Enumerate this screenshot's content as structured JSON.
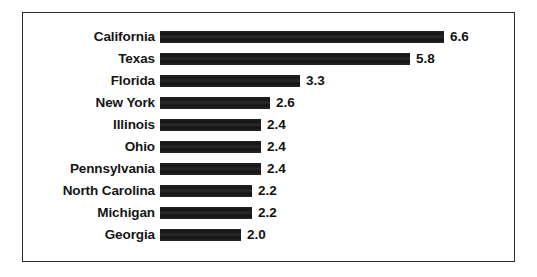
{
  "figure": {
    "frame_color": "#2b2b2b",
    "background_color": "#ffffff",
    "bar_color": "#1c1c1c",
    "text_color": "#151515"
  },
  "chart_data": {
    "type": "bar",
    "orientation": "horizontal",
    "title": "",
    "subtitle": "",
    "xlabel": "",
    "ylabel": "",
    "legend": [],
    "grid": false,
    "value_labels_shown": true,
    "xlim": [
      0,
      6.6
    ],
    "categories": [
      "California",
      "Texas",
      "Florida",
      "New York",
      "Illinois",
      "Ohio",
      "Pennsylvania",
      "North Carolina",
      "Michigan",
      "Georgia"
    ],
    "values": [
      6.6,
      5.8,
      3.3,
      2.6,
      2.4,
      2.4,
      2.4,
      2.2,
      2.2,
      2.0
    ],
    "value_text": [
      "6.6",
      "5.8",
      "3.3",
      "2.6",
      "2.4",
      "2.4",
      "2.4",
      "2.2",
      "2.2",
      "2.0"
    ],
    "rows": [
      {
        "label": "California",
        "value": 6.6,
        "value_text": "6.6",
        "bar_px": 284
      },
      {
        "label": "Texas",
        "value": 5.8,
        "value_text": "5.8",
        "bar_px": 250
      },
      {
        "label": "Florida",
        "value": 3.3,
        "value_text": "3.3",
        "bar_px": 140
      },
      {
        "label": "New York",
        "value": 2.6,
        "value_text": "2.6",
        "bar_px": 110
      },
      {
        "label": "Illinois",
        "value": 2.4,
        "value_text": "2.4",
        "bar_px": 101
      },
      {
        "label": "Ohio",
        "value": 2.4,
        "value_text": "2.4",
        "bar_px": 101
      },
      {
        "label": "Pennsylvania",
        "value": 2.4,
        "value_text": "2.4",
        "bar_px": 101
      },
      {
        "label": "North Carolina",
        "value": 2.2,
        "value_text": "2.2",
        "bar_px": 92
      },
      {
        "label": "Michigan",
        "value": 2.2,
        "value_text": "2.2",
        "bar_px": 92
      },
      {
        "label": "Georgia",
        "value": 2.0,
        "value_text": "2.0",
        "bar_px": 81
      }
    ]
  }
}
